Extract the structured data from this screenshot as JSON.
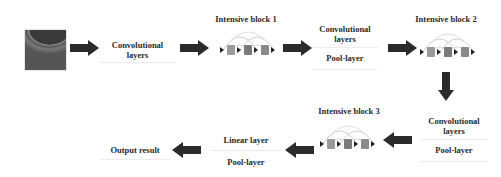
{
  "diagram": {
    "input_image": {
      "icon": "oct-scan-image"
    },
    "row1": {
      "conv1": {
        "line1": "Convolutional",
        "line2": "layers"
      },
      "block1": {
        "title": "Intensive block 1"
      },
      "conv_pool1": {
        "line1": "Convolutional",
        "line2": "layers",
        "pool": "Pool-layer"
      },
      "block2": {
        "title": "Intensive block 2"
      }
    },
    "row2": {
      "conv_pool2": {
        "line1": "Convolutional",
        "line2": "layers",
        "pool": "Pool-layer"
      },
      "block3": {
        "title": "Intensive block 3"
      },
      "linear_pool": {
        "linear": "Linear layer",
        "pool": "Pool-layer"
      },
      "output": {
        "label": "Output result"
      }
    },
    "colors": {
      "arrow": "#2b2b2b",
      "cube": "#8a8a8a",
      "arc": "#cccccc"
    }
  }
}
